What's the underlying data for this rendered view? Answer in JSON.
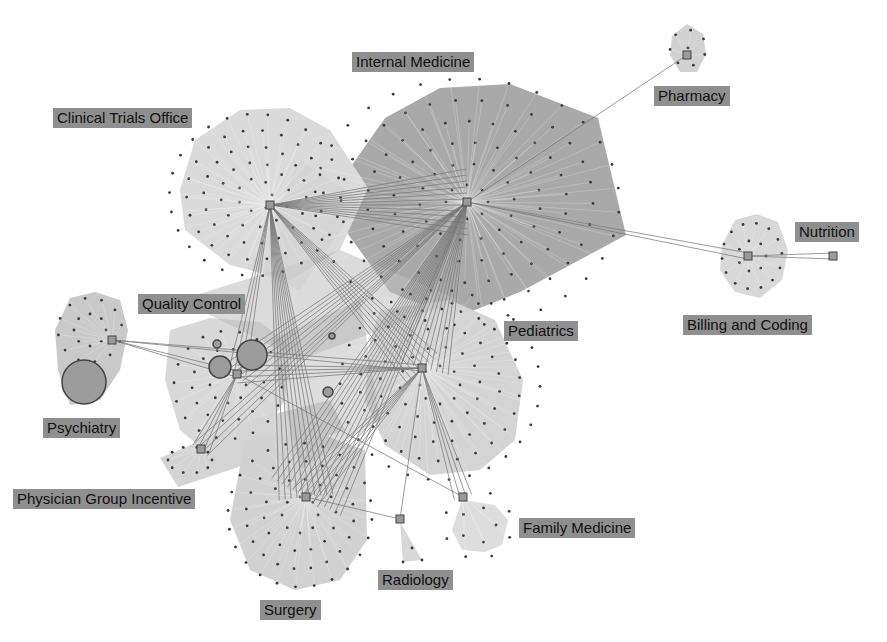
{
  "diagram": {
    "type": "clustered-network",
    "colors": {
      "background": "#ffffff",
      "label_bg": "#8f8f8f",
      "label_text": "#111111",
      "hull_light": "#d6d6d6",
      "hull_mid": "#c4c4c4",
      "hull_dark": "#a6a6a6",
      "edge": "#7a7a7a",
      "node": "#3a3a3a",
      "hub_fill": "#9a9a9a",
      "hub_stroke": "#444444",
      "big_node_fill": "#9c9c9c"
    },
    "clusters": [
      {
        "id": "internal-medicine",
        "label": "Internal Medicine",
        "label_pos": [
          352,
          52
        ],
        "hub": [
          467,
          202
        ],
        "fill": "#a9a9a9",
        "hull": [
          [
            345,
            175
          ],
          [
            385,
            118
          ],
          [
            440,
            88
          ],
          [
            510,
            84
          ],
          [
            598,
            118
          ],
          [
            626,
            235
          ],
          [
            520,
            292
          ],
          [
            455,
            318
          ],
          [
            390,
            292
          ],
          [
            345,
            230
          ]
        ],
        "rings": [
          [
            20,
            8
          ],
          [
            45,
            14
          ],
          [
            70,
            20
          ],
          [
            95,
            26
          ],
          [
            120,
            30
          ],
          [
            145,
            32
          ]
        ],
        "ring_center": [
          467,
          202
        ],
        "scale": [
          1.05,
          0.85
        ]
      },
      {
        "id": "clinical-trials-office",
        "label": "Clinical Trials Office",
        "label_pos": [
          53,
          108
        ],
        "hub": [
          270,
          205
        ],
        "fill": "#dadada",
        "hull": [
          [
            180,
            190
          ],
          [
            195,
            140
          ],
          [
            240,
            110
          ],
          [
            290,
            108
          ],
          [
            330,
            130
          ],
          [
            368,
            188
          ],
          [
            340,
            250
          ],
          [
            290,
            280
          ],
          [
            230,
            265
          ],
          [
            185,
            230
          ]
        ],
        "rings": [
          [
            18,
            7
          ],
          [
            36,
            12
          ],
          [
            54,
            18
          ],
          [
            72,
            22
          ],
          [
            90,
            26
          ]
        ],
        "ring_center": [
          255,
          195
        ],
        "scale": [
          0.95,
          0.9
        ]
      },
      {
        "id": "pharmacy",
        "label": "Pharmacy",
        "label_pos": [
          654,
          86
        ],
        "hub": [
          687,
          55
        ],
        "fill": "#d2d2d2",
        "hull": [
          [
            672,
            36
          ],
          [
            687,
            24
          ],
          [
            703,
            34
          ],
          [
            706,
            54
          ],
          [
            697,
            72
          ],
          [
            680,
            72
          ],
          [
            670,
            55
          ]
        ],
        "rings": [
          [
            0,
            1
          ],
          [
            18,
            7
          ]
        ],
        "ring_center": [
          688,
          48
        ],
        "scale": [
          1,
          1
        ]
      },
      {
        "id": "billing-and-coding",
        "label": "Billing and Coding",
        "label_pos": [
          683,
          315
        ],
        "hub": [
          748,
          256
        ],
        "fill": "#d8d8d8",
        "hull": [
          [
            722,
            245
          ],
          [
            735,
            220
          ],
          [
            757,
            214
          ],
          [
            778,
            222
          ],
          [
            788,
            250
          ],
          [
            782,
            280
          ],
          [
            760,
            298
          ],
          [
            735,
            292
          ],
          [
            720,
            270
          ]
        ],
        "rings": [
          [
            14,
            7
          ],
          [
            30,
            14
          ]
        ],
        "ring_center": [
          752,
          256
        ],
        "scale": [
          1,
          1.1
        ]
      },
      {
        "id": "nutrition",
        "label": "Nutrition",
        "label_pos": [
          795,
          222
        ],
        "hub": [
          833,
          256
        ],
        "fill": "#d8d8d8",
        "hull": [],
        "rings": [],
        "ring_center": [
          833,
          256
        ],
        "scale": [
          1,
          1
        ]
      },
      {
        "id": "pediatrics",
        "label": "Pediatrics",
        "label_pos": [
          504,
          321
        ],
        "hub": [
          422,
          368
        ],
        "fill": "#d4d4d4",
        "hull": [
          [
            380,
            310
          ],
          [
            450,
            300
          ],
          [
            495,
            320
          ],
          [
            523,
            380
          ],
          [
            515,
            440
          ],
          [
            480,
            470
          ],
          [
            430,
            475
          ],
          [
            385,
            445
          ],
          [
            365,
            400
          ],
          [
            370,
            340
          ]
        ],
        "rings": [
          [
            20,
            8
          ],
          [
            40,
            14
          ],
          [
            60,
            20
          ],
          [
            80,
            26
          ],
          [
            100,
            30
          ]
        ],
        "ring_center": [
          440,
          385
        ],
        "scale": [
          1,
          0.95
        ]
      },
      {
        "id": "quality-control",
        "label": "Quality Control",
        "label_pos": [
          138,
          294
        ],
        "hub": [
          237,
          374
        ],
        "fill": "#d8d8d8",
        "hull": [
          [
            170,
            330
          ],
          [
            210,
            318
          ],
          [
            260,
            322
          ],
          [
            290,
            345
          ],
          [
            285,
            400
          ],
          [
            260,
            440
          ],
          [
            210,
            455
          ],
          [
            180,
            430
          ],
          [
            165,
            380
          ]
        ],
        "rings": [
          [
            18,
            8
          ],
          [
            36,
            14
          ],
          [
            54,
            18
          ]
        ],
        "ring_center": [
          228,
          385
        ],
        "scale": [
          1,
          1
        ]
      },
      {
        "id": "psychiatry",
        "label": "Psychiatry",
        "label_pos": [
          43,
          418
        ],
        "hub": [
          112,
          340
        ],
        "fill": "#c9c9c9",
        "hull": [
          [
            55,
            330
          ],
          [
            70,
            298
          ],
          [
            95,
            292
          ],
          [
            120,
            300
          ],
          [
            128,
            330
          ],
          [
            120,
            370
          ],
          [
            100,
            400
          ],
          [
            70,
            405
          ],
          [
            58,
            370
          ]
        ],
        "rings": [
          [
            16,
            8
          ],
          [
            32,
            12
          ]
        ],
        "ring_center": [
          90,
          330
        ],
        "scale": [
          1,
          1
        ]
      },
      {
        "id": "physician-group-incentive",
        "label": "Physician Group Incentive",
        "label_pos": [
          13,
          489
        ],
        "hub": [
          201,
          449
        ],
        "fill": "#d4d4d4",
        "hull": [
          [
            160,
            458
          ],
          [
            250,
            420
          ],
          [
            330,
            400
          ],
          [
            345,
            430
          ],
          [
            260,
            460
          ],
          [
            178,
            487
          ]
        ],
        "rings": [
          [
            22,
            10
          ]
        ],
        "ring_center": [
          190,
          460
        ],
        "scale": [
          1,
          0.6
        ]
      },
      {
        "id": "surgery",
        "label": "Surgery",
        "label_pos": [
          260,
          600
        ],
        "hub": [
          306,
          497
        ],
        "fill": "#d2d2d2",
        "hull": [
          [
            245,
            440
          ],
          [
            310,
            430
          ],
          [
            365,
            450
          ],
          [
            367,
            540
          ],
          [
            340,
            580
          ],
          [
            295,
            590
          ],
          [
            250,
            570
          ],
          [
            230,
            520
          ]
        ],
        "rings": [
          [
            18,
            8
          ],
          [
            36,
            14
          ],
          [
            54,
            20
          ],
          [
            72,
            24
          ]
        ],
        "ring_center": [
          300,
          515
        ],
        "scale": [
          1,
          1
        ]
      },
      {
        "id": "radiology",
        "label": "Radiology",
        "label_pos": [
          378,
          570
        ],
        "hub": [
          400,
          519
        ],
        "fill": "#d8d8d8",
        "hull": [
          [
            400,
            522
          ],
          [
            422,
            560
          ],
          [
            403,
            562
          ]
        ],
        "rings": [],
        "ring_center": [
          405,
          545
        ],
        "scale": [
          1,
          1
        ]
      },
      {
        "id": "family-medicine",
        "label": "Family Medicine",
        "label_pos": [
          519,
          518
        ],
        "hub": [
          463,
          497
        ],
        "fill": "#dddddd",
        "hull": [
          [
            462,
            500
          ],
          [
            495,
            505
          ],
          [
            508,
            520
          ],
          [
            502,
            545
          ],
          [
            485,
            552
          ],
          [
            462,
            550
          ],
          [
            452,
            530
          ]
        ],
        "rings": [
          [
            18,
            5
          ],
          [
            34,
            8
          ]
        ],
        "ring_center": [
          478,
          525
        ],
        "scale": [
          1,
          1
        ]
      }
    ],
    "big_nodes": [
      {
        "id": "psychiatry-big",
        "center": [
          84,
          382
        ],
        "r": 22
      },
      {
        "id": "qc-big-1",
        "center": [
          252,
          355
        ],
        "r": 15
      },
      {
        "id": "qc-big-2",
        "center": [
          220,
          367
        ],
        "r": 11
      },
      {
        "id": "qc-small-1",
        "center": [
          217,
          344
        ],
        "r": 4
      },
      {
        "id": "center-small-1",
        "center": [
          328,
          392
        ],
        "r": 5
      },
      {
        "id": "center-small-2",
        "center": [
          332,
          336
        ],
        "r": 3
      }
    ],
    "edges": [
      [
        "clinical-trials-office",
        "internal-medicine",
        12
      ],
      [
        "clinical-trials-office",
        "pediatrics",
        8
      ],
      [
        "clinical-trials-office",
        "surgery",
        10
      ],
      [
        "clinical-trials-office",
        "quality-control",
        4
      ],
      [
        "internal-medicine",
        "pediatrics",
        10
      ],
      [
        "internal-medicine",
        "surgery",
        14
      ],
      [
        "internal-medicine",
        "quality-control",
        6
      ],
      [
        "internal-medicine",
        "physician-group-incentive",
        4
      ],
      [
        "internal-medicine",
        "pharmacy",
        1
      ],
      [
        "internal-medicine",
        "billing-and-coding",
        2
      ],
      [
        "billing-and-coding",
        "nutrition",
        2
      ],
      [
        "pediatrics",
        "surgery",
        6
      ],
      [
        "pediatrics",
        "family-medicine",
        4
      ],
      [
        "pediatrics",
        "quality-control",
        4
      ],
      [
        "psychiatry",
        "pediatrics",
        2
      ],
      [
        "psychiatry",
        "quality-control",
        2
      ],
      [
        "quality-control",
        "physician-group-incentive",
        4
      ],
      [
        "quality-control",
        "family-medicine",
        1
      ],
      [
        "surgery",
        "radiology",
        1
      ],
      [
        "pediatrics",
        "radiology",
        1
      ]
    ]
  }
}
